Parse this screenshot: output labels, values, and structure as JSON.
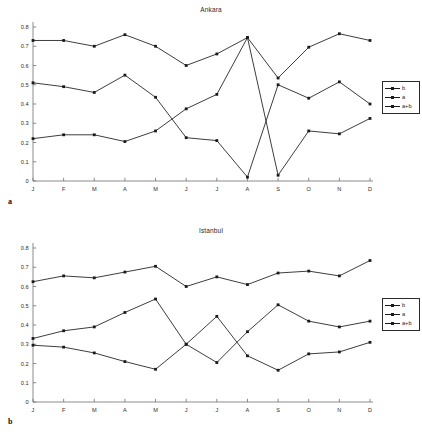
{
  "figure": {
    "panels": [
      {
        "panel_label": "a",
        "title": "Ankara",
        "legend": {
          "position": "right",
          "items": [
            "b",
            "a",
            "a+b"
          ]
        }
      },
      {
        "panel_label": "b",
        "title": "Istanbul",
        "legend": {
          "position": "right",
          "items": [
            "b",
            "a",
            "a+b"
          ]
        }
      }
    ]
  },
  "axis": {
    "y_ticks": [
      "0",
      "0.1",
      "0.2",
      "0.3",
      "0.4",
      "0.5",
      "0.6",
      "0.7",
      "0.8"
    ],
    "x_ticks": [
      "J",
      "F",
      "M",
      "A",
      "M",
      "J",
      "J",
      "A",
      "S",
      "O",
      "N",
      "D"
    ]
  },
  "colors": {
    "line": "#1a1a1a",
    "axis": "#6f6f6f",
    "text": "#2b2b2b"
  },
  "chart_data": [
    {
      "type": "line",
      "title": "Ankara",
      "panel_label": "a",
      "xlabel": "",
      "ylabel": "",
      "ylim": [
        0,
        0.8
      ],
      "yticks": [
        0,
        0.1,
        0.2,
        0.3,
        0.4,
        0.5,
        0.6,
        0.7,
        0.8
      ],
      "grid": false,
      "legend_position": "right",
      "categories": [
        "J",
        "F",
        "M",
        "A",
        "M",
        "J",
        "J",
        "A",
        "S",
        "O",
        "N",
        "D"
      ],
      "series": [
        {
          "name": "b",
          "values": [
            0.73,
            0.73,
            0.7,
            0.76,
            0.7,
            0.6,
            0.66,
            0.745,
            0.535,
            0.695,
            0.765,
            0.73
          ]
        },
        {
          "name": "a",
          "values": [
            0.51,
            0.49,
            0.46,
            0.55,
            0.435,
            0.225,
            0.21,
            0.02,
            0.5,
            0.43,
            0.515,
            0.4
          ]
        },
        {
          "name": "a+b",
          "values": [
            0.22,
            0.24,
            0.24,
            0.205,
            0.26,
            0.375,
            0.45,
            0.745,
            0.03,
            0.26,
            0.245,
            0.325
          ]
        }
      ]
    },
    {
      "type": "line",
      "title": "Istanbul",
      "panel_label": "b",
      "xlabel": "",
      "ylabel": "",
      "ylim": [
        0,
        0.8
      ],
      "yticks": [
        0,
        0.1,
        0.2,
        0.3,
        0.4,
        0.5,
        0.6,
        0.7,
        0.8
      ],
      "grid": false,
      "legend_position": "right",
      "categories": [
        "J",
        "F",
        "M",
        "A",
        "M",
        "J",
        "J",
        "A",
        "S",
        "O",
        "N",
        "D"
      ],
      "series": [
        {
          "name": "b",
          "values": [
            0.625,
            0.655,
            0.645,
            0.675,
            0.705,
            0.6,
            0.65,
            0.61,
            0.67,
            0.68,
            0.655,
            0.735
          ]
        },
        {
          "name": "a",
          "values": [
            0.33,
            0.37,
            0.39,
            0.465,
            0.535,
            0.3,
            0.205,
            0.365,
            0.505,
            0.42,
            0.39,
            0.42
          ]
        },
        {
          "name": "a+b",
          "values": [
            0.295,
            0.285,
            0.255,
            0.21,
            0.17,
            0.3,
            0.445,
            0.24,
            0.165,
            0.25,
            0.26,
            0.31
          ]
        }
      ]
    }
  ]
}
